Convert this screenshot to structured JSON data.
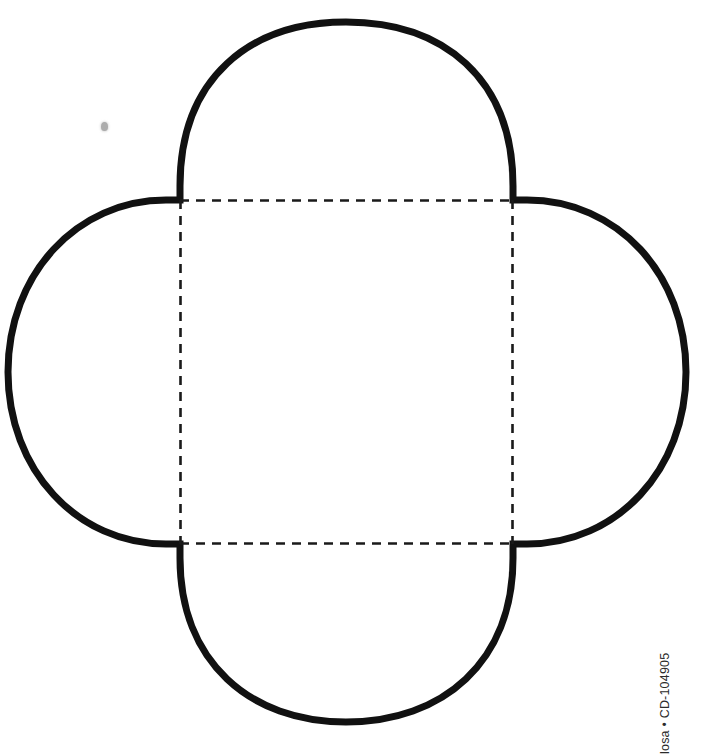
{
  "page": {
    "background_color": "#ffffff",
    "width": 703,
    "height": 749,
    "document_type": "printable craft template"
  },
  "template": {
    "name": "four-petal-box-template",
    "description": "Four-lobed (quatrefoil) gift box cutting template with a dashed square fold area at center",
    "stroke_color": "#111111",
    "stroke_width": 7,
    "fold_line_color": "#1a1a1a",
    "fold_line_style": "dashed",
    "fold_line_width": 2.6,
    "fold_dash_pattern": "9 7",
    "fill_color": "#ffffff",
    "center_square": {
      "left": 180,
      "top": 200,
      "right": 513,
      "bottom": 544,
      "width": 333,
      "height": 344
    },
    "lobes": [
      {
        "name": "top-lobe",
        "extreme": 20,
        "axis": "y"
      },
      {
        "name": "right-lobe",
        "extreme": 686,
        "axis": "x"
      },
      {
        "name": "bottom-lobe",
        "extreme": 722,
        "axis": "y"
      },
      {
        "name": "left-lobe",
        "extreme": 8,
        "axis": "x"
      }
    ],
    "cut_path": "M 180 200 L 180 186 C 180 78 250 22 346 22 C 443 22 513 78 513 186 L 513 200 L 527 200 C 617 200 686 274 686 372 C 686 470 617 544 527 544 L 513 544 L 513 558 C 513 662 443 722 346 722 C 250 722 180 662 180 558 L 180 544 L 166 544 C 77 544 8 470 8 372 C 8 274 77 200 166 200 Z"
  },
  "caption": {
    "text": "losa • CD-104905",
    "product_code": "CD-104905",
    "separator": "•",
    "orientation": "vertical-rotated-90",
    "color": "#2b2b2b"
  },
  "artifacts": {
    "smudge": {
      "name": "scan-smudge",
      "x": 101,
      "y": 122,
      "color": "#9a9a9a"
    }
  }
}
